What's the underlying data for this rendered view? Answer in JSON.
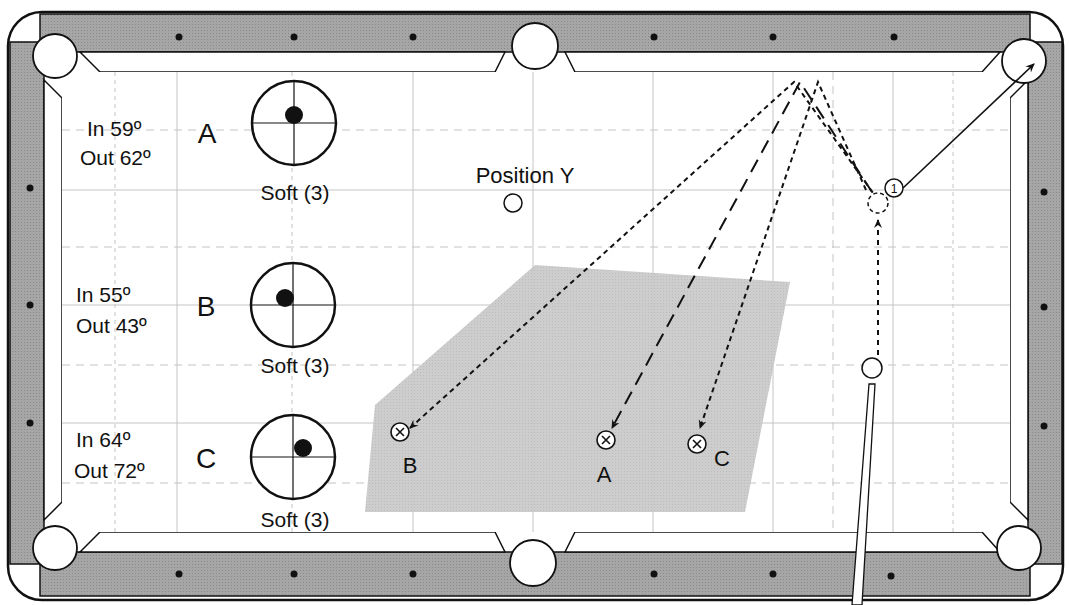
{
  "diagram": {
    "type": "pool-table-shot-diagram",
    "colors": {
      "rail": "#a8a8a8",
      "cloth": "#ffffff",
      "grid": "#bdbdbd",
      "zone": "#c8c8c8",
      "ink": "#111111"
    },
    "position_label": "Position Y",
    "object_ball_label": "1",
    "shots": [
      {
        "id": "A",
        "in_text": "In 59º",
        "out_text": "Out 62º",
        "letter": "A",
        "speed": "Soft (3)",
        "tip_x": 0,
        "tip_y": -0.25,
        "target_label": "A"
      },
      {
        "id": "B",
        "in_text": "In 55º",
        "out_text": "Out 43º",
        "letter": "B",
        "speed": "Soft (3)",
        "tip_x": -0.2,
        "tip_y": 0,
        "target_label": "B"
      },
      {
        "id": "C",
        "in_text": "In 64º",
        "out_text": "Out 72º",
        "letter": "C",
        "speed": "Soft (3)",
        "tip_x": 0.2,
        "tip_y": -0.15,
        "target_label": "C"
      }
    ]
  }
}
